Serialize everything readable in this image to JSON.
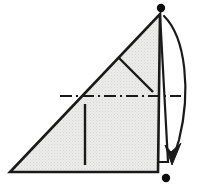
{
  "figure": {
    "title": "Rotation of a shaded right triangle about a vertical axis",
    "type": "technical-geometry-diagram",
    "canvas": {
      "width": 197,
      "height": 189,
      "background": "#ffffff"
    },
    "colors": {
      "outline": "#1a1a1a",
      "fill": "#e8e8e6",
      "centerline": "#1a1a1a",
      "arrow": "#1a1a1a",
      "axis_point": "#0d0d0d"
    },
    "stroke_widths": {
      "outline": 2.6,
      "inner_construction": 2.4,
      "centerline": 2.0,
      "arc": 2.2,
      "sliver": 2.2
    },
    "shaded_triangle": {
      "name": "shaded-right-triangle",
      "fill_pattern": "light-gray-stipple",
      "vertices": [
        {
          "label": "apex",
          "x": 160,
          "y": 14
        },
        {
          "label": "bottom-right",
          "x": 158,
          "y": 172
        },
        {
          "label": "bottom-left",
          "x": 10,
          "y": 172
        }
      ]
    },
    "right_sliver": {
      "name": "right-edge-sliver",
      "description": "thin quadrilateral strip along the right side of the triangle",
      "points": [
        {
          "x": 160,
          "y": 14
        },
        {
          "x": 168,
          "y": 162
        },
        {
          "x": 158,
          "y": 162
        },
        {
          "x": 158,
          "y": 20
        }
      ]
    },
    "centerline": {
      "name": "rotation-axis-centerline",
      "style": "dash-dot",
      "dash_pattern": "12 4 2 4",
      "x1": 60,
      "y1": 96,
      "x2": 181,
      "y2": 96
    },
    "inner_lines": [
      {
        "name": "inner-diagonal-line",
        "x1": 118,
        "y1": 57,
        "x2": 153,
        "y2": 92
      },
      {
        "name": "inner-vertical-line",
        "x1": 85,
        "y1": 104,
        "x2": 85,
        "y2": 165
      }
    ],
    "axis_points": [
      {
        "name": "top-axis-point",
        "cx": 161,
        "cy": 8,
        "r": 4.2
      },
      {
        "name": "bottom-axis-point",
        "cx": 166,
        "cy": 178,
        "r": 4.2
      }
    ],
    "rotation_arrow": {
      "name": "rotation-direction-arrow",
      "path": "M 164 16 C 186 38, 191 92, 179 140 C 176 150, 174 155, 172 159",
      "direction": "downward-clockwise",
      "arrowhead": {
        "name": "arrowhead",
        "points": "172 164 166 146 171 152 180 144"
      }
    }
  }
}
